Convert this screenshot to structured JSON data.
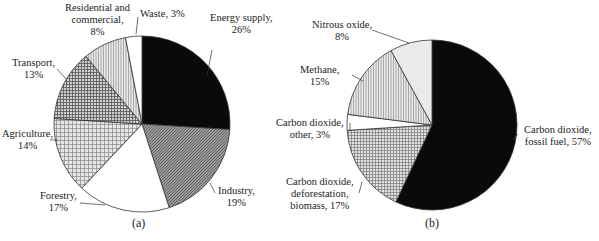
{
  "chart_data": [
    {
      "type": "pie",
      "panel": "(a)",
      "title": "",
      "categories": [
        "Energy supply",
        "Industry",
        "Forestry",
        "Agriculture",
        "Transport",
        "Residential and commercial",
        "Waste"
      ],
      "values": [
        26,
        19,
        17,
        14,
        13,
        8,
        3
      ],
      "labels": [
        {
          "line1": "Energy supply,",
          "line2": "26%"
        },
        {
          "line1": "Industry,",
          "line2": "19%"
        },
        {
          "line1": "Forestry,",
          "line2": "17%"
        },
        {
          "line1": "Agriculture,",
          "line2": "14%"
        },
        {
          "line1": "Transport,",
          "line2": "13%"
        },
        {
          "line1": "Residential and",
          "line2": "commercial,",
          "line3": "8%"
        },
        {
          "line1": "Waste, 3%"
        }
      ],
      "fills": [
        "black",
        "dense-gray-hatch",
        "white",
        "light-grid",
        "dark-grid",
        "vertical-stripes",
        "white"
      ],
      "start": "12 o'clock, clockwise",
      "caption": "(a)"
    },
    {
      "type": "pie",
      "panel": "(b)",
      "title": "",
      "categories": [
        "Carbon dioxide, fossil fuel",
        "Carbon dioxide, deforestation, biomass",
        "Carbon dioxide, other",
        "Methane",
        "Nitrous oxide"
      ],
      "values": [
        57,
        17,
        3,
        15,
        8
      ],
      "labels": [
        {
          "line1": "Carbon dioxide,",
          "line2": "fossil fuel, 57%"
        },
        {
          "line1": "Carbon dioxide,",
          "line2": "deforestation,",
          "line3": "biomass, 17%"
        },
        {
          "line1": "Carbon dioxide,",
          "line2": "other, 3%"
        },
        {
          "line1": "Methane,",
          "line2": "15%"
        },
        {
          "line1": "Nitrous oxide,",
          "line2": "8%"
        }
      ],
      "fills": [
        "black",
        "grid",
        "white",
        "vertical-stripes",
        "light-dots"
      ],
      "start": "12 o'clock, clockwise",
      "caption": "(b)"
    }
  ]
}
